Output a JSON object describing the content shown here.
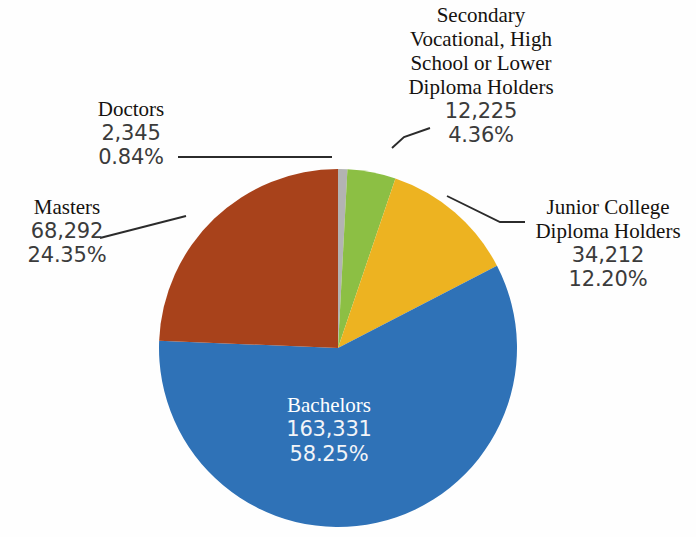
{
  "chart_data": {
    "type": "pie",
    "title": "",
    "subtitle": "",
    "xlabel": "",
    "ylabel": "",
    "legend_position": "none",
    "grid": false,
    "label_style": "callout-with-leader-lines",
    "total": 280405,
    "categories": [
      "Doctors",
      "Masters",
      "Bachelors",
      "Junior College Diploma Holders",
      "Secondary Vocational, High School or Lower Diploma Holders"
    ],
    "values": [
      2345,
      68292,
      163331,
      34212,
      12225
    ],
    "percentages": [
      0.84,
      24.35,
      58.25,
      12.2,
      4.36
    ],
    "colors": [
      "#b3b3b3",
      "#a8421b",
      "#2f72b7",
      "#edb321",
      "#8cbf44"
    ],
    "slices": [
      {
        "id": "doctors",
        "name": "Doctors",
        "value": "2,345",
        "percent": "0.84%",
        "percent_number": 0.84,
        "value_number": 2345,
        "color": "#b3b3b3",
        "label_placement": "outside-left",
        "start_angle_deg": 0,
        "end_angle_deg": 3.024
      },
      {
        "id": "secondary",
        "name": "Secondary Vocational, High School or Lower Diploma Holders",
        "value": "12,225",
        "percent": "4.36%",
        "percent_number": 4.36,
        "value_number": 12225,
        "color": "#8cbf44",
        "label_placement": "outside-top-right",
        "start_angle_deg": 3.024,
        "end_angle_deg": 18.72
      },
      {
        "id": "junior",
        "name": "Junior College Diploma Holders",
        "value": "34,212",
        "percent": "12.20%",
        "percent_number": 12.2,
        "value_number": 34212,
        "color": "#edb321",
        "label_placement": "outside-right",
        "start_angle_deg": 18.72,
        "end_angle_deg": 62.64
      },
      {
        "id": "bachelors",
        "name": "Bachelors",
        "value": "163,331",
        "percent": "58.25%",
        "percent_number": 58.25,
        "value_number": 163331,
        "color": "#2f72b7",
        "label_placement": "inside",
        "start_angle_deg": 62.64,
        "end_angle_deg": 272.34
      },
      {
        "id": "masters",
        "name": "Masters",
        "value": "68,292",
        "percent": "24.35%",
        "percent_number": 24.35,
        "value_number": 68292,
        "color": "#a8421b",
        "label_placement": "outside-left",
        "start_angle_deg": 272.34,
        "end_angle_deg": 360
      }
    ],
    "geometry": {
      "center_x": 338,
      "center_y": 348,
      "radius": 179,
      "start_at": "12-o-clock",
      "direction": "clockwise"
    }
  },
  "labels": {
    "secondary": {
      "line1": "Secondary",
      "line2": "Vocational, High",
      "line3": "School or Lower",
      "line4": "Diploma Holders",
      "value": "12,225",
      "percent": "4.36%"
    },
    "doctors": {
      "name": "Doctors",
      "value": "2,345",
      "percent": "0.84%"
    },
    "masters": {
      "name": "Masters",
      "value": "68,292",
      "percent": "24.35%"
    },
    "junior": {
      "line1": "Junior College",
      "line2": "Diploma Holders",
      "value": "34,212",
      "percent": "12.20%"
    },
    "bachelors": {
      "name": "Bachelors",
      "value": "163,331",
      "percent": "58.25%"
    }
  }
}
